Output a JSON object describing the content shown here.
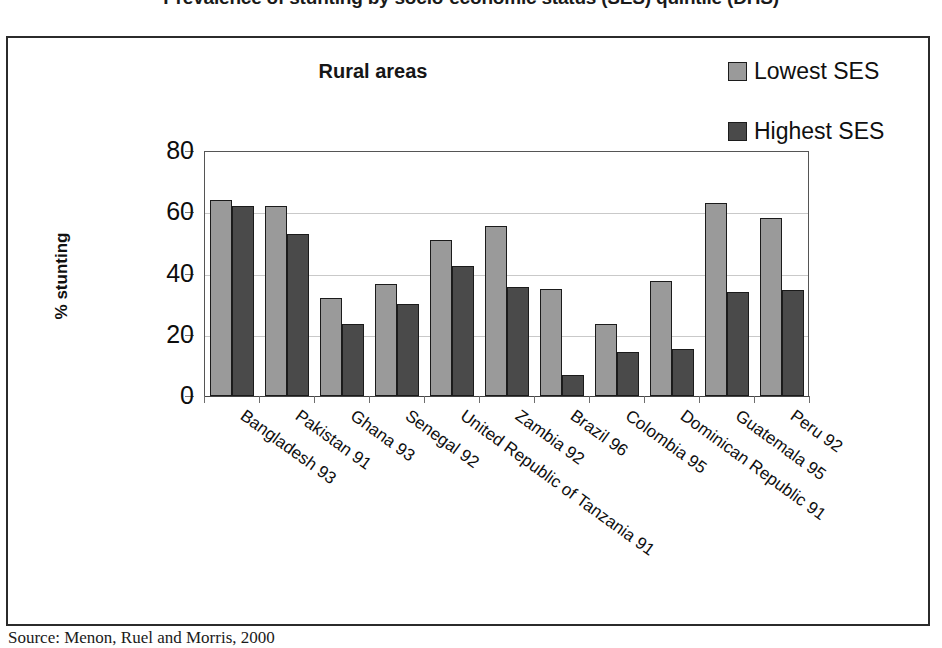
{
  "figure": {
    "title": "Prevalence of stunting by socio-economic status (SES) quintile (DHS)",
    "source": "Source:  Menon, Ruel and Morris, 2000"
  },
  "legend": {
    "position": "top-right",
    "items": [
      {
        "label": "Lowest SES",
        "color": "#9a9a9a",
        "swatch_icon": "legend-swatch-icon"
      },
      {
        "label": "Highest SES",
        "color": "#4a4a4a",
        "swatch_icon": "legend-swatch-icon"
      }
    ]
  },
  "axes": {
    "ylabel": "% stunting",
    "yticks": [
      "80",
      "60",
      "40",
      "20",
      "0"
    ],
    "xlabel": ""
  },
  "chart_data": {
    "type": "bar",
    "title": "Rural areas",
    "xlabel": "",
    "ylabel": "% stunting",
    "ylim": [
      0,
      80
    ],
    "ytick_values": [
      0,
      20,
      40,
      60,
      80
    ],
    "grid": true,
    "legend_position": "top-right",
    "categories": [
      "Bangladesh 93",
      "Pakistan 91",
      "Ghana 93",
      "Senegal 92",
      "United Republic of Tanzania 91",
      "Zambia 92",
      "Brazil 96",
      "Colombia 95",
      "Dominican Republic 91",
      "Guatemala 95",
      "Peru 92"
    ],
    "series": [
      {
        "name": "Lowest SES",
        "color": "#9a9a9a",
        "values": [
          64,
          62,
          32,
          36.5,
          51,
          55.5,
          35,
          23.5,
          37.5,
          63,
          58
        ]
      },
      {
        "name": "Highest SES",
        "color": "#4a4a4a",
        "values": [
          62,
          53,
          23.5,
          30,
          42.5,
          35.5,
          7,
          14.5,
          15.5,
          34,
          34.5
        ]
      }
    ]
  }
}
